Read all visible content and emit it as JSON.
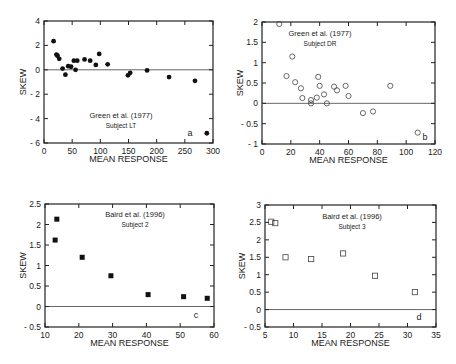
{
  "chart_data": [
    {
      "panel": "a",
      "type": "scatter",
      "title": "Green et al. (1977)",
      "subtitle": "Subject LT",
      "xlabel": "MEAN RESPONSE",
      "ylabel": "SKEW",
      "xlim": [
        0,
        300
      ],
      "ylim": [
        -6,
        4
      ],
      "xticks": [
        0,
        50,
        100,
        150,
        200,
        250,
        300
      ],
      "yticks": [
        -6,
        -4,
        -2,
        0,
        2,
        4
      ],
      "zero_line": true,
      "marker": "filled-circle",
      "x": [
        17,
        22,
        24,
        27,
        33,
        38,
        43,
        48,
        53,
        56,
        59,
        72,
        82,
        92,
        98,
        113,
        149,
        153,
        183,
        222,
        268,
        289
      ],
      "y": [
        2.35,
        1.25,
        1.15,
        0.9,
        0.1,
        -0.4,
        0.3,
        0.25,
        0.75,
        0.0,
        0.75,
        0.85,
        0.75,
        0.4,
        1.3,
        0.45,
        -0.45,
        -0.25,
        -0.05,
        -0.6,
        -0.9,
        -5.2
      ]
    },
    {
      "panel": "b",
      "type": "scatter",
      "title": "Green et al. (1977)",
      "subtitle": "Subject DR",
      "xlabel": "MEAN RESPONSE",
      "ylabel": "SKEW",
      "xlim": [
        0,
        120
      ],
      "ylim": [
        -1,
        2
      ],
      "xticks": [
        0,
        20,
        40,
        60,
        80,
        100,
        120
      ],
      "yticks": [
        -1,
        -0.5,
        0,
        0.5,
        1,
        1.5,
        2
      ],
      "zero_line": true,
      "marker": "open-circle",
      "x": [
        12,
        17,
        21,
        23,
        27,
        28,
        34,
        34,
        38,
        39,
        40,
        43,
        45,
        50,
        52,
        58,
        60,
        70,
        77,
        89,
        108
      ],
      "y": [
        1.95,
        0.67,
        1.15,
        0.52,
        0.37,
        0.13,
        0.08,
        0.0,
        0.14,
        0.65,
        0.43,
        0.22,
        0.0,
        0.41,
        0.32,
        0.43,
        0.18,
        -0.24,
        -0.2,
        0.43,
        -0.72
      ]
    },
    {
      "panel": "c",
      "type": "scatter",
      "title": "Baird et al. (1996)",
      "subtitle": "Subject 2",
      "xlabel": "MEAN RESPONSE",
      "ylabel": "SKEW",
      "xlim": [
        10,
        60
      ],
      "ylim": [
        -0.5,
        2.5
      ],
      "xticks": [
        10,
        20,
        30,
        40,
        50,
        60
      ],
      "yticks": [
        -0.5,
        0,
        0.5,
        1,
        1.5,
        2,
        2.5
      ],
      "zero_line": true,
      "marker": "filled-square",
      "x": [
        13,
        13.5,
        21,
        29.5,
        40.5,
        51,
        58
      ],
      "y": [
        1.62,
        2.13,
        1.2,
        0.75,
        0.29,
        0.24,
        0.2
      ]
    },
    {
      "panel": "d",
      "type": "scatter",
      "title": "Baird et al. (1996)",
      "subtitle": "Subject 3",
      "xlabel": "MEAN RESPONSE",
      "ylabel": "SKEW",
      "xlim": [
        5,
        35
      ],
      "ylim": [
        -0.5,
        3
      ],
      "xticks": [
        5,
        10,
        15,
        20,
        25,
        30,
        35
      ],
      "yticks": [
        -0.5,
        0,
        0.5,
        1,
        1.5,
        2,
        2.5,
        3
      ],
      "zero_line": true,
      "marker": "open-square",
      "x": [
        6.1,
        6.8,
        8.6,
        13.1,
        18.7,
        24.3,
        31.3
      ],
      "y": [
        2.52,
        2.48,
        1.5,
        1.45,
        1.61,
        0.97,
        0.5
      ]
    }
  ],
  "layout": {
    "panels": [
      {
        "box": [
          44,
          21,
          213,
          143
        ],
        "yl_x": 26,
        "xl_y": 162,
        "ann": [
          121,
          118,
          128
        ],
        "letter": [
          190,
          136
        ]
      },
      {
        "box": [
          262,
          22,
          435,
          144
        ],
        "yl_x": 243,
        "xl_y": 163,
        "ann": [
          320,
          36,
          46
        ],
        "letter": [
          425,
          140
        ]
      },
      {
        "box": [
          45,
          204,
          214,
          327
        ],
        "yl_x": 26,
        "xl_y": 346,
        "ann": [
          135,
          217,
          227
        ],
        "letter": [
          196,
          318
        ]
      },
      {
        "box": [
          265,
          205,
          436,
          327
        ],
        "yl_x": 245,
        "xl_y": 346,
        "ann": [
          352,
          219,
          229
        ],
        "letter": [
          419,
          320
        ]
      }
    ]
  }
}
